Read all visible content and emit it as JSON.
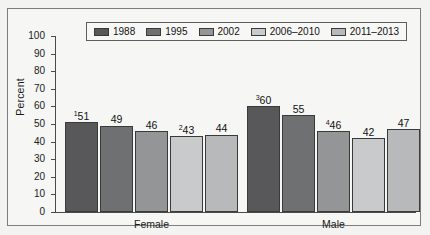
{
  "chart_data": {
    "type": "bar",
    "title": "",
    "subtitle": "",
    "xlabel": "",
    "ylabel": "Percent",
    "ylim": [
      0,
      100
    ],
    "yticks": [
      0,
      10,
      20,
      30,
      40,
      50,
      60,
      70,
      80,
      90,
      100
    ],
    "grid": false,
    "legend_position": "top-center",
    "categories": [
      "Female",
      "Male"
    ],
    "series": [
      {
        "name": "1988",
        "color": "#58585a",
        "values": [
          51,
          60
        ],
        "labels": [
          "51",
          "60"
        ],
        "footnotes": [
          "1",
          "3"
        ]
      },
      {
        "name": "1995",
        "color": "#6f7072",
        "values": [
          49,
          55
        ],
        "labels": [
          "49",
          "55"
        ],
        "footnotes": [
          "",
          ""
        ]
      },
      {
        "name": "2002",
        "color": "#949597",
        "values": [
          46,
          46
        ],
        "labels": [
          "46",
          "46"
        ],
        "footnotes": [
          "",
          "4"
        ]
      },
      {
        "name": "2006–2010",
        "color": "#c9cacb",
        "values": [
          43,
          42
        ],
        "labels": [
          "43",
          "42"
        ],
        "footnotes": [
          "2",
          ""
        ]
      },
      {
        "name": "2011–2013",
        "color": "#b8b9bb",
        "values": [
          44,
          47
        ],
        "labels": [
          "44",
          "47"
        ],
        "footnotes": [
          "",
          ""
        ]
      }
    ]
  },
  "axis": {
    "y_title": "Percent",
    "tick_labels": [
      "100",
      "90",
      "80",
      "70",
      "60",
      "50",
      "40",
      "30",
      "20",
      "10",
      "0"
    ]
  },
  "legend": {
    "entries": [
      {
        "label": "1988"
      },
      {
        "label": "1995"
      },
      {
        "label": "2002"
      },
      {
        "label": "2006–2010"
      },
      {
        "label": "2011–2013"
      }
    ]
  },
  "groups": [
    {
      "label": "Female"
    },
    {
      "label": "Male"
    }
  ]
}
